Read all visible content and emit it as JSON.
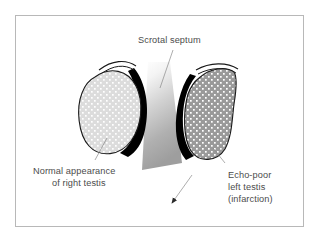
{
  "figure": {
    "kind": "medical-illustration",
    "frame_border_color": "#b8b8b8",
    "background_color": "#ffffff"
  },
  "labels": {
    "septum": {
      "id": "scrotal-septum",
      "text": "Scrotal septum",
      "text_color": "#4c4c4c"
    },
    "right_testis": {
      "id": "normal-right-testis",
      "line1": "Normal appearance",
      "line2": "of right testis",
      "text_color": "#4c4c4c"
    },
    "left_testis": {
      "id": "echo-poor-left-testis",
      "line1": "Echo-poor",
      "line2": "left testis",
      "line3": "(infarction)",
      "text_color": "#4c4c4c"
    }
  },
  "structures": {
    "right_testis": {
      "name": "right testis",
      "fill_color": "#dcdcdc",
      "stipple_color": "#ffffff",
      "outline_color": "#1a1a1a",
      "echo_description": "normal echotexture"
    },
    "left_testis": {
      "name": "left testis",
      "fill_color": "#9a9a9a",
      "stipple_color": "#ffffff",
      "outline_color": "#1a1a1a",
      "echo_description": "echo-poor (infarction)"
    },
    "septum": {
      "name": "scrotal septum",
      "gradient_top_color": "#ffffff",
      "gradient_bottom_color": "#9e9e9e"
    },
    "epididymis_right": {
      "name": "right epididymal crescent",
      "fill_color": "#000000"
    },
    "epididymis_left": {
      "name": "left epididymal crescent",
      "fill_color": "#000000"
    },
    "arrow": {
      "name": "septum pointer arrow",
      "color": "#2b2b2b"
    }
  }
}
